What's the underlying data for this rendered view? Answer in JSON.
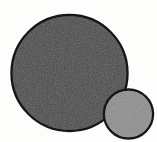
{
  "image": {
    "title": "Two overlapping filled circles",
    "width": 157,
    "height": 142,
    "background_color": "#fdfdfc"
  },
  "shapes": {
    "large_circle": {
      "name": "large dark gray circle",
      "cx": 69.5,
      "cy": 73,
      "r": 58,
      "fill_color": "#474747",
      "stroke_color": "#181818",
      "stroke_width": 2.4
    },
    "small_circle": {
      "name": "small medium gray circle",
      "cx": 128.5,
      "cy": 114,
      "r": 24.5,
      "fill_color": "#8d8d8d",
      "stroke_color": "#161616",
      "stroke_width": 2.4
    }
  },
  "labels": {
    "large_circle_label": "",
    "small_circle_label": ""
  }
}
